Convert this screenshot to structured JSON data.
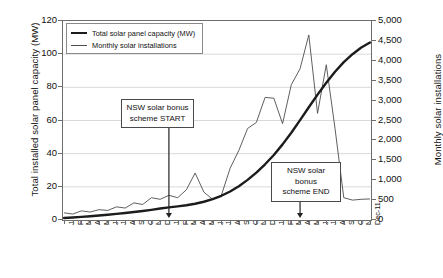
{
  "chart_data": {
    "type": "line",
    "title": "",
    "xlabel": "",
    "ylabel": "Total installed solar panel capacity (MW)",
    "y2label": "Monthly solar installations",
    "ylim": [
      0,
      120
    ],
    "y2lim": [
      0,
      5000
    ],
    "yticks": [
      "0",
      "20",
      "40",
      "60",
      "80",
      "100",
      "120"
    ],
    "y2ticks": [
      "0",
      "500",
      "1,000",
      "1,500",
      "2,000",
      "2,500",
      "3,000",
      "3,500",
      "4,000",
      "4,500",
      "5,000"
    ],
    "grid": true,
    "legend_position": "top-left",
    "categories": [
      "Jan-09",
      "Feb-09",
      "Mar-09",
      "Apr-09",
      "May-09",
      "Jun-09",
      "Jul-09",
      "Aug-09",
      "Sep-09",
      "Oct-09",
      "Nov-09",
      "Dec-09",
      "Jan-10",
      "Feb-10",
      "Mar-10",
      "Apr-10",
      "May-10",
      "Jun-10",
      "Jul-10",
      "Aug-10",
      "Sep-10",
      "Oct-10",
      "Nov-10",
      "Dec-10",
      "Jan-11",
      "Feb-11",
      "Mar-11",
      "Apr-11",
      "May-11",
      "Jun-11",
      "Jul-11",
      "Aug-11",
      "Sep-11",
      "Oct-11",
      "Nov-11",
      "Dec-11"
    ],
    "series": [
      {
        "name": "Total solar panel capacity (MW)",
        "axis": "left",
        "unit": "MW",
        "style": "thick",
        "color": "#1c1c1c",
        "values": [
          1.2,
          1.5,
          1.9,
          2.3,
          2.7,
          3.2,
          3.7,
          4.2,
          4.8,
          5.4,
          6.1,
          6.9,
          7.6,
          8.2,
          8.9,
          9.8,
          11.0,
          12.6,
          14.6,
          17.2,
          20.4,
          24.2,
          28.6,
          33.6,
          39.2,
          45.6,
          52.6,
          60.2,
          68.0,
          75.6,
          82.8,
          89.4,
          95.2,
          100.0,
          104.0,
          107.0
        ]
      },
      {
        "name": "Monthly solar installations",
        "axis": "right",
        "unit": "installations",
        "style": "thin",
        "color": "#4d4d4d",
        "values": [
          180,
          150,
          230,
          200,
          260,
          240,
          330,
          300,
          430,
          390,
          560,
          520,
          620,
          560,
          760,
          1180,
          700,
          520,
          620,
          1300,
          1750,
          2300,
          2450,
          3080,
          3060,
          2420,
          3400,
          3800,
          4650,
          2680,
          3900,
          2300,
          560,
          500,
          520,
          530
        ]
      }
    ],
    "annotations": [
      {
        "text_line1": "NSW solar bonus",
        "text_line2": "scheme START",
        "at_category": "Jan-10"
      },
      {
        "text_line1": "NSW solar bonus",
        "text_line2": "scheme END",
        "at_category": "Apr-11"
      }
    ]
  },
  "legend": {
    "items": [
      {
        "label": "Total solar panel capacity (MW)"
      },
      {
        "label": "Monthly solar installations"
      }
    ]
  }
}
